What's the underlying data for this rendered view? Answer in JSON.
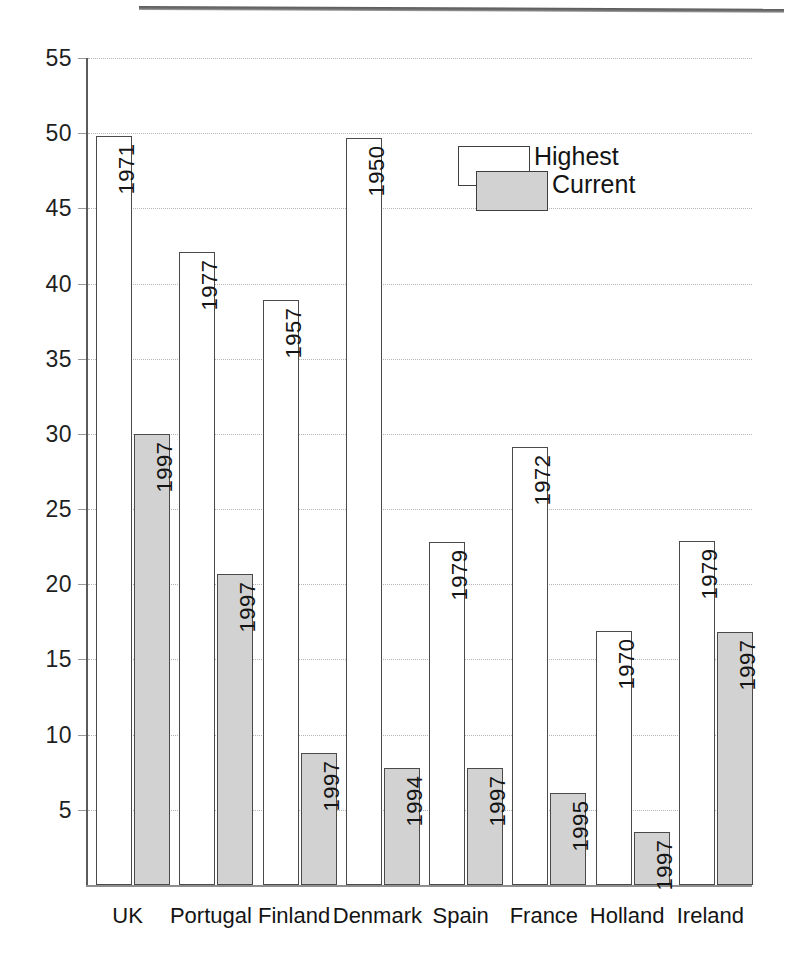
{
  "chart_data": {
    "type": "bar",
    "title": "",
    "subtitle": "",
    "xlabel": "",
    "ylabel": "",
    "ylim": [
      0,
      55
    ],
    "ytick_step": 5,
    "yticks": [
      "5",
      "10",
      "15",
      "20",
      "25",
      "30",
      "35",
      "40",
      "45",
      "50",
      "55"
    ],
    "grid": true,
    "legend_position": "inside-top-right",
    "categories": [
      "UK",
      "Portugal",
      "Finland",
      "Denmark",
      "Spain",
      "France",
      "Holland",
      "Ireland"
    ],
    "series": [
      {
        "name": "Highest",
        "color": "#ffffff",
        "values": [
          49.8,
          42.1,
          38.9,
          49.7,
          22.8,
          29.1,
          16.9,
          22.9
        ],
        "point_labels": [
          "1971",
          "1977",
          "1957",
          "1950",
          "1979",
          "1972",
          "1970",
          "1979"
        ]
      },
      {
        "name": "Current",
        "color": "#d2d2d2",
        "values": [
          30.0,
          20.7,
          8.8,
          7.8,
          7.8,
          6.1,
          3.5,
          16.8
        ],
        "point_labels": [
          "1997",
          "1997",
          "1997",
          "1994",
          "1997",
          "1995",
          "1997",
          "1997"
        ]
      }
    ]
  },
  "legend": {
    "highest_label": "Highest",
    "current_label": "Current"
  },
  "colors": {
    "highest_fill": "#ffffff",
    "current_fill": "#d2d2d2",
    "bar_stroke": "#4a4a4a",
    "gridline": "#b4b4b4",
    "axis": "#5b5b5b",
    "text": "#141414"
  }
}
